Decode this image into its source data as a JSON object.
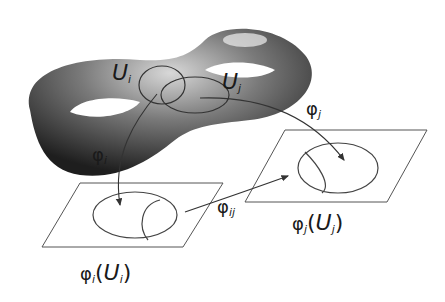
{
  "diagram": {
    "surface": "double-torus",
    "labels": {
      "Ui": {
        "main": "U",
        "sub": "i"
      },
      "Uj": {
        "main": "U",
        "sub": "j"
      },
      "phi_i": {
        "main": "φ",
        "sub": "i"
      },
      "phi_j": {
        "main": "φ",
        "sub": "j"
      },
      "phi_ij": {
        "main": "φ",
        "sub": "ij"
      },
      "phi_i_Ui": {
        "phi": "φ",
        "phi_sub": "i",
        "open": "(",
        "U": "U",
        "U_sub": "i",
        "close": ")"
      },
      "phi_j_Uj": {
        "phi": "φ",
        "phi_sub": "j",
        "open": "(",
        "U": "U",
        "U_sub": "j",
        "close": ")"
      }
    },
    "colors": {
      "line": "#333333",
      "surface_dark": "#2a2a2a",
      "surface_light": "#e8e8e8",
      "background": "#ffffff"
    }
  }
}
